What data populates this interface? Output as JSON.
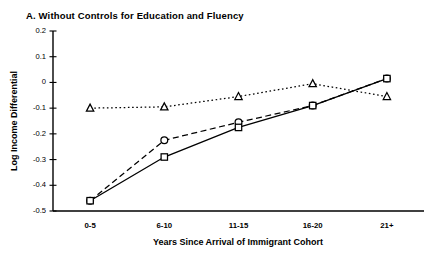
{
  "panel": {
    "title": "A.  Without Controls for Education and Fluency"
  },
  "chart_data": {
    "type": "line",
    "title": "A.  Without Controls for Education and Fluency",
    "xlabel": "Years Since Arrival of Immigrant Cohort",
    "ylabel": "Log Income Differential",
    "categories": [
      "0-5",
      "6-10",
      "11-15",
      "16-20",
      "21+"
    ],
    "ylim": [
      -0.5,
      0.2
    ],
    "yticks": [
      0.2,
      0.1,
      0,
      -0.1,
      -0.2,
      -0.3,
      -0.4,
      -0.5
    ],
    "ytick_labels": [
      "0.2",
      "0.1",
      "0",
      "-0.1",
      "-0.2",
      "-0.3",
      "-0.4",
      "-0.5"
    ],
    "grid": false,
    "legend": "none",
    "series": [
      {
        "name": "Triangle series",
        "marker": "triangle",
        "line_style": "dotted",
        "color": "#000000",
        "values": [
          -0.1,
          -0.095,
          -0.055,
          -0.005,
          -0.055
        ]
      },
      {
        "name": "Circle series",
        "marker": "circle",
        "line_style": "dashed",
        "color": "#000000",
        "values": [
          -0.46,
          -0.225,
          -0.155,
          -0.09,
          0.015
        ]
      },
      {
        "name": "Square series",
        "marker": "square",
        "line_style": "solid",
        "color": "#000000",
        "values": [
          -0.46,
          -0.29,
          -0.175,
          -0.09,
          0.015
        ]
      }
    ]
  }
}
